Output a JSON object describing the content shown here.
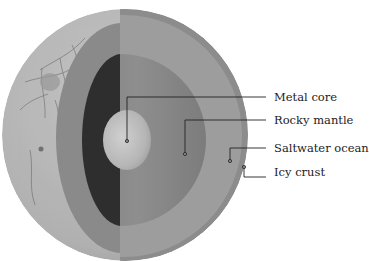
{
  "diagram": {
    "colors": {
      "background": "#ffffff",
      "surface": "#b8b8b8",
      "surface_cracks": "#6e6e6e",
      "crust_cut": "#8a8a8a",
      "ocean_face": "#9d9d9d",
      "crust_edge": "#8c8c8c",
      "mantle_dark": "#2e2e2e",
      "mantle_face": "#858585",
      "core": "#c2c2c2",
      "leader_line": "#222222",
      "label_text": "#222222"
    },
    "labels": [
      {
        "id": "metal-core",
        "text": "Metal core"
      },
      {
        "id": "rocky-mantle",
        "text": "Rocky mantle"
      },
      {
        "id": "saltwater-ocean",
        "text": "Saltwater ocean"
      },
      {
        "id": "icy-crust",
        "text": "Icy crust"
      }
    ]
  }
}
